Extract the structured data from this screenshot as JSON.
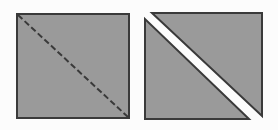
{
  "figure": {
    "description": "Two gray squares side by side. The left square shows a dashed diagonal cut line from its top-left corner to its bottom-right corner. The right square is separated along that same diagonal into two triangular halves pulled slightly apart, leaving a white gap between them.",
    "background_color": "#fcfcfc",
    "panel_count": 2
  },
  "style": {
    "fill_color": "#9a9a9a",
    "stroke_color": "#3a3a3a",
    "gap_color": "#ffffff",
    "stroke_width": 2,
    "dash_pattern": "6 3",
    "dash_width": 2
  },
  "panels": [
    {
      "id": "left-panel",
      "name": "square-with-dashed-diagonal",
      "label": "",
      "shape": "square",
      "x": 16,
      "y": 13,
      "width": 114,
      "height": 106,
      "fill": "#9a9a9a",
      "stroke": "#3a3a3a",
      "diagonal": {
        "name": "dashed-diagonal-line",
        "style": "dashed",
        "from": [
          16,
          13
        ],
        "to": [
          130,
          119
        ],
        "color": "#3a3a3a"
      }
    },
    {
      "id": "right-panel",
      "name": "square-split-into-two-triangles",
      "label": "",
      "shape": "split-square",
      "x": 145,
      "y": 13,
      "width": 117,
      "height": 106,
      "fill": "#9a9a9a",
      "stroke": "#3a3a3a",
      "gap": {
        "name": "white-diagonal-gap",
        "color": "#ffffff",
        "width": 6,
        "orientation": "top-left-to-bottom-right"
      },
      "triangles": [
        {
          "name": "upper-right-triangle",
          "points": "152,13 262,13 262,116"
        },
        {
          "name": "lower-left-triangle",
          "points": "145,19 145,119 249,119"
        }
      ]
    }
  ]
}
